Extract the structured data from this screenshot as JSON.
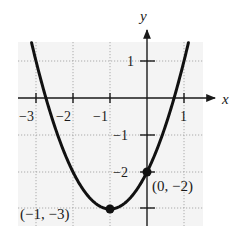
{
  "chart_data": {
    "type": "line",
    "title": "",
    "function": "y = x^2 + 2x - 2",
    "xlabel": "x",
    "ylabel": "y",
    "xlim": [
      -3.5,
      1.5
    ],
    "ylim": [
      -3.5,
      1.5
    ],
    "grid": true,
    "grid_style": "dotted",
    "x_ticks": [
      -3,
      -2,
      -1,
      1
    ],
    "x_tick_labels": [
      "−3",
      "−2",
      "−1",
      "1"
    ],
    "y_ticks": [
      1,
      -1,
      -2,
      -3
    ],
    "y_tick_labels": [
      "1",
      "−1",
      "−2",
      ""
    ],
    "series": [
      {
        "name": "parabola",
        "x": [
          -3.3,
          -3,
          -2.5,
          -2,
          -1.5,
          -1,
          -0.5,
          0,
          0.5,
          1,
          1.3
        ],
        "y": [
          2.29,
          1,
          -0.75,
          -2,
          -2.75,
          -3,
          -2.75,
          -2,
          -0.75,
          1,
          2.29
        ]
      }
    ],
    "points": [
      {
        "x": -1,
        "y": -3,
        "label": "(−1, −3)",
        "role": "vertex"
      },
      {
        "x": 0,
        "y": -2,
        "label": "(0, −2)",
        "role": "y-intercept"
      }
    ],
    "colors": {
      "curve": "#111111",
      "grid": "#9a9a9a",
      "axis": "#1a1a1a",
      "background": "#f4f4f4"
    }
  },
  "axes": {
    "x_label": "x",
    "y_label": "y"
  },
  "annotations": {
    "vertex": "(−1, −3)",
    "intercept": "(0, −2)"
  }
}
